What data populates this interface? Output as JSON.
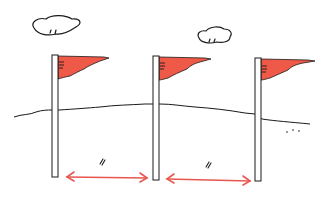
{
  "illustration": {
    "description": "Three flags on poles placed at equal intervals along a ground line",
    "colors": {
      "flag": "#ef5a48",
      "arrow": "#e8574f",
      "ink": "#1a1a1a",
      "background": "#ffffff"
    },
    "flags": [
      {
        "pole_x": 52,
        "top_y": 55,
        "bottom_y": 177
      },
      {
        "pole_x": 153,
        "top_y": 56,
        "bottom_y": 180
      },
      {
        "pole_x": 255,
        "top_y": 57,
        "bottom_y": 181
      }
    ],
    "intervals": [
      {
        "mark": "//",
        "from_x": 66,
        "to_x": 148,
        "y": 177
      },
      {
        "mark": "//",
        "from_x": 166,
        "to_x": 251,
        "y": 180
      }
    ],
    "clouds": 2,
    "ellipsis": "· · ·"
  }
}
